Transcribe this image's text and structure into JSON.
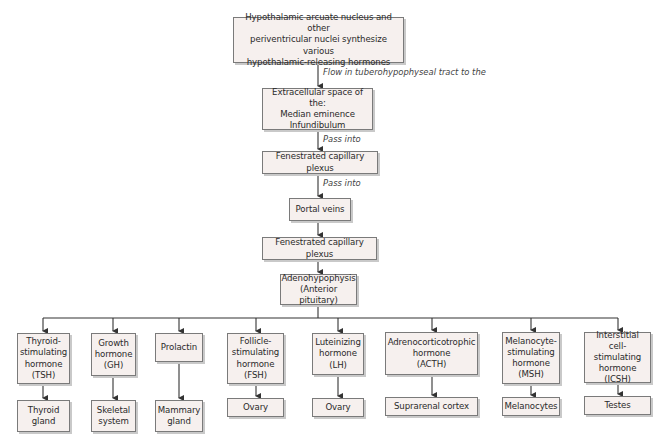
{
  "diagram": {
    "type": "flowchart",
    "colors": {
      "box_fill": "#f6f0ee",
      "box_border": "#7a7a7a",
      "line": "#333333"
    },
    "chain": [
      {
        "id": "hypothalamus",
        "text": "Hypothalamic arcuate nucleus and other\nperiventricular nuclei synthesize various\nhypothalamic-releasing hormones"
      },
      {
        "id": "extracellular",
        "text": "Extracellular space of the:\nMedian eminence\nInfundibulum"
      },
      {
        "id": "capillary1",
        "text": "Fenestrated capillary plexus"
      },
      {
        "id": "portal",
        "text": "Portal veins"
      },
      {
        "id": "capillary2",
        "text": "Fenestrated capillary plexus"
      },
      {
        "id": "adeno",
        "text": "Adenohypophysis\n(Anterior pituitary)"
      }
    ],
    "edge_labels": {
      "flow": "Flow in tuberohypophyseal tract to the",
      "pass1": "Pass into",
      "pass2": "Pass into"
    },
    "hormones": [
      {
        "name": "Thyroid-\nstimulating\nhormone\n(TSH)",
        "target": "Thyroid\ngland"
      },
      {
        "name": "Growth\nhormone\n(GH)",
        "target": "Skeletal\nsystem"
      },
      {
        "name": "Prolactin",
        "target": "Mammary\ngland"
      },
      {
        "name": "Follicle-\nstimulating\nhormone\n(FSH)",
        "target": "Ovary"
      },
      {
        "name": "Luteinizing\nhormone\n(LH)",
        "target": "Ovary"
      },
      {
        "name": "Adrenocorticotrophic\nhormone\n(ACTH)",
        "target": "Suprarenal cortex"
      },
      {
        "name": "Melanocyte-\nstimulating\nhormone\n(MSH)",
        "target": "Melanocytes"
      },
      {
        "name": "Interstitial cell-\nstimulating\nhormone\n(ICSH)",
        "target": "Testes"
      }
    ]
  }
}
